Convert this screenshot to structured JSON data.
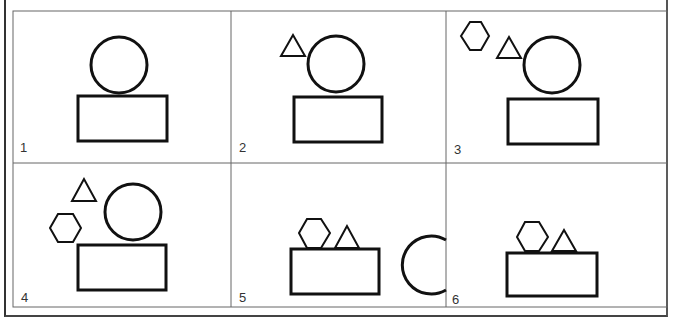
{
  "panels": [
    {
      "label": "1",
      "shapes": [
        "circle",
        "rectangle"
      ]
    },
    {
      "label": "2",
      "shapes": [
        "triangle",
        "circle",
        "rectangle"
      ]
    },
    {
      "label": "3",
      "shapes": [
        "hexagon",
        "triangle",
        "circle",
        "rectangle"
      ]
    },
    {
      "label": "4",
      "shapes": [
        "triangle",
        "hexagon",
        "circle",
        "rectangle"
      ]
    },
    {
      "label": "5",
      "shapes": [
        "hexagon",
        "triangle",
        "rectangle",
        "circle"
      ]
    },
    {
      "label": "6",
      "shapes": [
        "hexagon",
        "triangle",
        "rectangle"
      ]
    }
  ],
  "colors": {
    "stroke": "#111111",
    "grid": "#666666",
    "background": "#ffffff"
  }
}
